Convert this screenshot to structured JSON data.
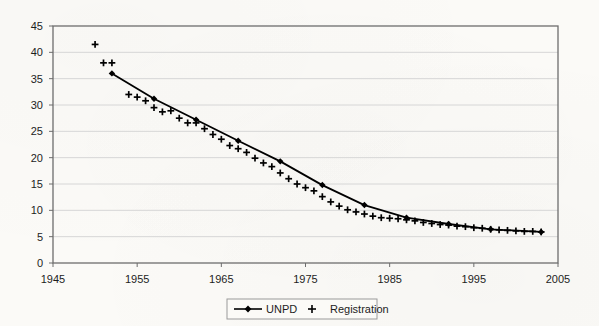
{
  "chart_data": {
    "type": "line",
    "title": "",
    "xlabel": "",
    "ylabel": "",
    "xlim": [
      1945,
      2005
    ],
    "ylim": [
      0,
      45
    ],
    "xticks": [
      1945,
      1955,
      1965,
      1975,
      1985,
      1995,
      2005
    ],
    "yticks": [
      0,
      5,
      10,
      15,
      20,
      25,
      30,
      35,
      40,
      45
    ],
    "grid": "horizontal",
    "legend_position": "bottom-center",
    "series": [
      {
        "name": "UNPD",
        "style": "line-with-diamond-markers",
        "color": "#000000",
        "x": [
          1952,
          1957,
          1962,
          1967,
          1972,
          1977,
          1982,
          1987,
          1992,
          1997,
          2003
        ],
        "values": [
          36.0,
          31.2,
          27.2,
          23.2,
          19.3,
          14.8,
          11.0,
          8.6,
          7.4,
          6.4,
          5.9
        ]
      },
      {
        "name": "Registration",
        "style": "plus-markers",
        "color": "#000000",
        "x": [
          1950,
          1951,
          1952,
          1954,
          1955,
          1956,
          1957,
          1958,
          1959,
          1960,
          1961,
          1962,
          1963,
          1964,
          1965,
          1966,
          1967,
          1968,
          1969,
          1970,
          1971,
          1972,
          1973,
          1974,
          1975,
          1976,
          1977,
          1978,
          1979,
          1980,
          1981,
          1982,
          1983,
          1984,
          1985,
          1986,
          1987,
          1988,
          1989,
          1990,
          1991,
          1992,
          1993,
          1994,
          1995,
          1996,
          1997,
          1998,
          1999,
          2000,
          2001,
          2002,
          2003
        ],
        "values": [
          41.5,
          38.0,
          38.0,
          32.0,
          31.5,
          30.8,
          29.5,
          28.7,
          28.9,
          27.5,
          26.6,
          26.6,
          25.5,
          24.4,
          23.5,
          22.3,
          21.7,
          21.0,
          19.9,
          19.0,
          18.3,
          17.1,
          16.0,
          15.0,
          14.3,
          13.7,
          12.6,
          11.6,
          10.8,
          10.1,
          9.7,
          9.3,
          8.9,
          8.6,
          8.5,
          8.4,
          8.2,
          8.0,
          7.7,
          7.5,
          7.3,
          7.2,
          7.0,
          6.9,
          6.7,
          6.6,
          6.4,
          6.3,
          6.2,
          6.1,
          6.0,
          6.0,
          5.9
        ]
      }
    ],
    "legend": [
      {
        "label": "UNPD",
        "marker": "line-diamond"
      },
      {
        "label": "Registration",
        "marker": "plus"
      }
    ]
  },
  "colors": {
    "plot_border": "#6d6d6d",
    "gridline": "#d6d6d6",
    "series_line": "#000000",
    "text": "#1d1d1d",
    "background": "#fbfaf7"
  }
}
